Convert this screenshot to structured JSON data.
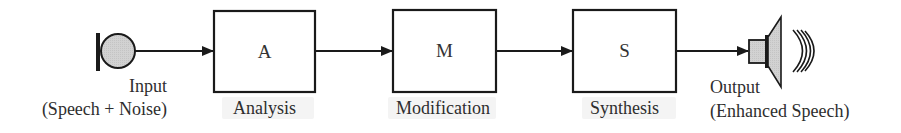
{
  "diagram": {
    "type": "block-diagram",
    "flow": "left-to-right",
    "input": {
      "icon": "microphone-icon",
      "label": "Input",
      "sublabel": "(Speech + Noise)"
    },
    "blocks": [
      {
        "letter": "A",
        "caption": "Analysis"
      },
      {
        "letter": "M",
        "caption": "Modification"
      },
      {
        "letter": "S",
        "caption": "Synthesis"
      }
    ],
    "output": {
      "icon": "speaker-icon",
      "label": "Output",
      "sublabel": "(Enhanced Speech)"
    },
    "edges": [
      {
        "from": "Input",
        "to": "A"
      },
      {
        "from": "A",
        "to": "M"
      },
      {
        "from": "M",
        "to": "S"
      },
      {
        "from": "S",
        "to": "Output"
      }
    ],
    "colors": {
      "stroke": "#1a1a1a",
      "fill_gray": "#cfcfcf",
      "text": "#2e2e2e"
    }
  }
}
